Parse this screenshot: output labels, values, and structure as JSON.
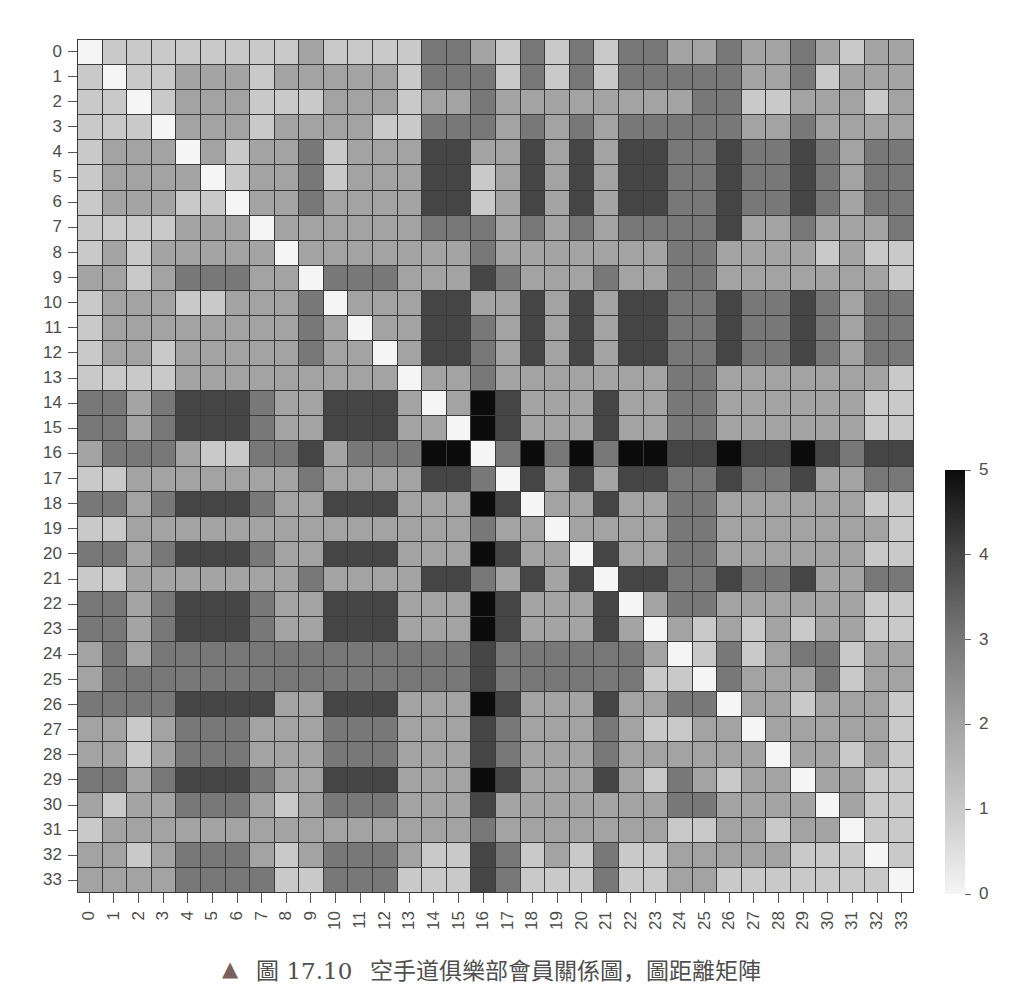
{
  "figure": {
    "caption": {
      "marker": "▲",
      "marker_color": "#7a605d",
      "label": "圖 17.10",
      "text": "空手道俱樂部會員關係圖，圖距離矩陣"
    }
  },
  "chart_data": {
    "type": "heatmap",
    "title": "",
    "xlabel": "",
    "ylabel": "",
    "xlabels": [
      "0",
      "1",
      "2",
      "3",
      "4",
      "5",
      "6",
      "7",
      "8",
      "9",
      "10",
      "11",
      "12",
      "13",
      "14",
      "15",
      "16",
      "17",
      "18",
      "19",
      "20",
      "21",
      "22",
      "23",
      "24",
      "25",
      "26",
      "27",
      "28",
      "29",
      "30",
      "31",
      "32",
      "33"
    ],
    "ylabels": [
      "0",
      "1",
      "2",
      "3",
      "4",
      "5",
      "6",
      "7",
      "8",
      "9",
      "10",
      "11",
      "12",
      "13",
      "14",
      "15",
      "16",
      "17",
      "18",
      "19",
      "20",
      "21",
      "22",
      "23",
      "24",
      "25",
      "26",
      "27",
      "28",
      "29",
      "30",
      "31",
      "32",
      "33"
    ],
    "value_range": [
      0,
      5
    ],
    "colormap": "Greys",
    "grid": true,
    "color_scale": {
      "0": "#f5f5f5",
      "1": "#c9c9c9",
      "2": "#a3a3a3",
      "3": "#787878",
      "4": "#454545",
      "5": "#0b0b0b"
    },
    "colorbar": {
      "position": "right",
      "ticks": [
        0,
        1,
        2,
        3,
        4,
        5
      ],
      "tick_labels": [
        "0",
        "1",
        "2",
        "3",
        "4",
        "5"
      ]
    },
    "matrix": [
      [
        0,
        1,
        1,
        1,
        1,
        1,
        1,
        1,
        1,
        2,
        1,
        1,
        1,
        1,
        3,
        3,
        2,
        1,
        3,
        1,
        3,
        1,
        3,
        3,
        2,
        2,
        3,
        2,
        2,
        3,
        2,
        1,
        2,
        2
      ],
      [
        1,
        0,
        1,
        1,
        2,
        2,
        2,
        1,
        2,
        2,
        2,
        2,
        2,
        1,
        3,
        3,
        3,
        1,
        3,
        1,
        3,
        1,
        3,
        3,
        3,
        3,
        3,
        2,
        2,
        3,
        1,
        2,
        2,
        2
      ],
      [
        1,
        1,
        0,
        1,
        2,
        2,
        2,
        1,
        1,
        1,
        2,
        2,
        2,
        1,
        2,
        2,
        3,
        2,
        2,
        2,
        2,
        2,
        2,
        2,
        2,
        3,
        3,
        1,
        1,
        2,
        2,
        2,
        1,
        2
      ],
      [
        1,
        1,
        1,
        0,
        2,
        2,
        2,
        1,
        2,
        2,
        2,
        2,
        1,
        1,
        3,
        3,
        3,
        2,
        3,
        2,
        3,
        2,
        3,
        3,
        3,
        3,
        3,
        2,
        2,
        3,
        2,
        2,
        2,
        2
      ],
      [
        1,
        2,
        2,
        2,
        0,
        2,
        1,
        2,
        2,
        3,
        1,
        2,
        2,
        2,
        4,
        4,
        2,
        2,
        4,
        2,
        4,
        2,
        4,
        4,
        3,
        3,
        4,
        3,
        3,
        4,
        3,
        2,
        3,
        3
      ],
      [
        1,
        2,
        2,
        2,
        2,
        0,
        1,
        2,
        2,
        3,
        1,
        2,
        2,
        2,
        4,
        4,
        1,
        2,
        4,
        2,
        4,
        2,
        4,
        4,
        3,
        3,
        4,
        3,
        3,
        4,
        3,
        2,
        3,
        3
      ],
      [
        1,
        2,
        2,
        2,
        1,
        1,
        0,
        2,
        2,
        3,
        2,
        2,
        2,
        2,
        4,
        4,
        1,
        2,
        4,
        2,
        4,
        2,
        4,
        4,
        3,
        3,
        4,
        3,
        3,
        4,
        3,
        2,
        3,
        3
      ],
      [
        1,
        1,
        1,
        1,
        2,
        2,
        2,
        0,
        2,
        2,
        2,
        2,
        2,
        2,
        3,
        3,
        3,
        2,
        3,
        2,
        3,
        2,
        3,
        3,
        3,
        3,
        4,
        2,
        2,
        3,
        2,
        2,
        2,
        3
      ],
      [
        1,
        2,
        1,
        2,
        2,
        2,
        2,
        2,
        0,
        2,
        2,
        2,
        2,
        2,
        2,
        2,
        3,
        2,
        2,
        2,
        2,
        2,
        2,
        2,
        3,
        3,
        2,
        2,
        2,
        2,
        1,
        2,
        1,
        1
      ],
      [
        2,
        2,
        1,
        2,
        3,
        3,
        3,
        2,
        2,
        0,
        3,
        3,
        3,
        2,
        2,
        2,
        4,
        3,
        2,
        2,
        2,
        3,
        2,
        2,
        3,
        3,
        2,
        2,
        2,
        2,
        2,
        2,
        2,
        1
      ],
      [
        1,
        2,
        2,
        2,
        1,
        1,
        2,
        2,
        2,
        3,
        0,
        2,
        2,
        2,
        4,
        4,
        2,
        2,
        4,
        2,
        4,
        2,
        4,
        4,
        3,
        3,
        4,
        3,
        3,
        4,
        3,
        2,
        3,
        3
      ],
      [
        1,
        2,
        2,
        2,
        2,
        2,
        2,
        2,
        2,
        3,
        2,
        0,
        2,
        2,
        4,
        4,
        3,
        2,
        4,
        2,
        4,
        2,
        4,
        4,
        3,
        3,
        4,
        3,
        3,
        4,
        3,
        2,
        3,
        3
      ],
      [
        1,
        2,
        2,
        1,
        2,
        2,
        2,
        2,
        2,
        3,
        2,
        2,
        0,
        2,
        4,
        4,
        3,
        2,
        4,
        2,
        4,
        2,
        4,
        4,
        3,
        3,
        4,
        3,
        3,
        4,
        3,
        2,
        3,
        3
      ],
      [
        1,
        1,
        1,
        1,
        2,
        2,
        2,
        2,
        2,
        2,
        2,
        2,
        2,
        0,
        2,
        2,
        3,
        2,
        2,
        2,
        2,
        2,
        2,
        2,
        3,
        3,
        2,
        2,
        2,
        2,
        2,
        2,
        2,
        1
      ],
      [
        3,
        3,
        2,
        3,
        4,
        4,
        4,
        3,
        2,
        2,
        4,
        4,
        4,
        2,
        0,
        2,
        5,
        4,
        2,
        2,
        2,
        4,
        2,
        2,
        3,
        3,
        2,
        2,
        2,
        2,
        2,
        2,
        1,
        1
      ],
      [
        3,
        3,
        2,
        3,
        4,
        4,
        4,
        3,
        2,
        2,
        4,
        4,
        4,
        2,
        2,
        0,
        5,
        4,
        2,
        2,
        2,
        4,
        2,
        2,
        3,
        3,
        2,
        2,
        2,
        2,
        2,
        2,
        1,
        1
      ],
      [
        2,
        3,
        3,
        3,
        2,
        1,
        1,
        3,
        3,
        4,
        2,
        3,
        3,
        3,
        5,
        5,
        0,
        3,
        5,
        3,
        5,
        3,
        5,
        5,
        4,
        4,
        5,
        4,
        4,
        5,
        4,
        3,
        4,
        4
      ],
      [
        1,
        1,
        2,
        2,
        2,
        2,
        2,
        2,
        2,
        3,
        2,
        2,
        2,
        2,
        4,
        4,
        3,
        0,
        4,
        2,
        4,
        2,
        4,
        4,
        3,
        3,
        4,
        3,
        3,
        4,
        2,
        2,
        3,
        3
      ],
      [
        3,
        3,
        2,
        3,
        4,
        4,
        4,
        3,
        2,
        2,
        4,
        4,
        4,
        2,
        2,
        2,
        5,
        4,
        0,
        2,
        2,
        4,
        2,
        2,
        3,
        3,
        2,
        2,
        2,
        2,
        2,
        2,
        1,
        1
      ],
      [
        1,
        1,
        2,
        2,
        2,
        2,
        2,
        2,
        2,
        2,
        2,
        2,
        2,
        2,
        2,
        2,
        3,
        2,
        2,
        0,
        2,
        2,
        2,
        2,
        3,
        3,
        2,
        2,
        2,
        2,
        2,
        2,
        2,
        1
      ],
      [
        3,
        3,
        2,
        3,
        4,
        4,
        4,
        3,
        2,
        2,
        4,
        4,
        4,
        2,
        2,
        2,
        5,
        4,
        2,
        2,
        0,
        4,
        2,
        2,
        3,
        3,
        2,
        2,
        2,
        2,
        2,
        2,
        1,
        1
      ],
      [
        1,
        1,
        2,
        2,
        2,
        2,
        2,
        2,
        2,
        3,
        2,
        2,
        2,
        2,
        4,
        4,
        3,
        2,
        4,
        2,
        4,
        0,
        4,
        4,
        3,
        3,
        4,
        3,
        3,
        4,
        2,
        2,
        3,
        3
      ],
      [
        3,
        3,
        2,
        3,
        4,
        4,
        4,
        3,
        2,
        2,
        4,
        4,
        4,
        2,
        2,
        2,
        5,
        4,
        2,
        2,
        2,
        4,
        0,
        2,
        3,
        3,
        2,
        2,
        2,
        2,
        2,
        2,
        1,
        1
      ],
      [
        3,
        3,
        2,
        3,
        4,
        4,
        4,
        3,
        2,
        2,
        4,
        4,
        4,
        2,
        2,
        2,
        5,
        4,
        2,
        2,
        2,
        4,
        2,
        0,
        2,
        1,
        2,
        1,
        2,
        1,
        2,
        2,
        1,
        1
      ],
      [
        2,
        3,
        2,
        3,
        3,
        3,
        3,
        3,
        3,
        3,
        3,
        3,
        3,
        3,
        3,
        3,
        4,
        3,
        3,
        3,
        3,
        3,
        3,
        2,
        0,
        1,
        3,
        1,
        2,
        3,
        3,
        1,
        2,
        2
      ],
      [
        2,
        3,
        3,
        3,
        3,
        3,
        3,
        3,
        3,
        3,
        3,
        3,
        3,
        3,
        3,
        3,
        4,
        3,
        3,
        3,
        3,
        3,
        3,
        1,
        1,
        0,
        3,
        2,
        2,
        2,
        3,
        1,
        2,
        2
      ],
      [
        3,
        3,
        3,
        3,
        4,
        4,
        4,
        4,
        2,
        2,
        4,
        4,
        4,
        2,
        2,
        2,
        5,
        4,
        2,
        2,
        2,
        4,
        2,
        2,
        3,
        3,
        0,
        2,
        2,
        1,
        2,
        2,
        2,
        1
      ],
      [
        2,
        2,
        1,
        2,
        3,
        3,
        3,
        2,
        2,
        2,
        3,
        3,
        3,
        2,
        2,
        2,
        4,
        3,
        2,
        2,
        2,
        3,
        2,
        1,
        1,
        2,
        2,
        0,
        2,
        2,
        2,
        2,
        2,
        1
      ],
      [
        2,
        2,
        1,
        2,
        3,
        3,
        3,
        2,
        2,
        2,
        3,
        3,
        3,
        2,
        2,
        2,
        4,
        3,
        2,
        2,
        2,
        3,
        2,
        2,
        2,
        2,
        2,
        2,
        0,
        2,
        2,
        1,
        2,
        1
      ],
      [
        3,
        3,
        2,
        3,
        4,
        4,
        4,
        3,
        2,
        2,
        4,
        4,
        4,
        2,
        2,
        2,
        5,
        4,
        2,
        2,
        2,
        4,
        2,
        1,
        3,
        2,
        1,
        2,
        2,
        0,
        2,
        2,
        1,
        1
      ],
      [
        2,
        1,
        2,
        2,
        3,
        3,
        3,
        2,
        1,
        2,
        3,
        3,
        3,
        2,
        2,
        2,
        4,
        2,
        2,
        2,
        2,
        2,
        2,
        2,
        3,
        3,
        2,
        2,
        2,
        2,
        0,
        2,
        1,
        1
      ],
      [
        1,
        2,
        2,
        2,
        2,
        2,
        2,
        2,
        2,
        2,
        2,
        2,
        2,
        2,
        2,
        2,
        3,
        2,
        2,
        2,
        2,
        2,
        2,
        2,
        1,
        1,
        2,
        2,
        1,
        2,
        2,
        0,
        1,
        1
      ],
      [
        2,
        2,
        1,
        2,
        3,
        3,
        3,
        2,
        1,
        2,
        3,
        3,
        3,
        2,
        1,
        1,
        4,
        3,
        1,
        2,
        1,
        3,
        1,
        1,
        2,
        2,
        2,
        2,
        2,
        1,
        1,
        1,
        0,
        1
      ],
      [
        2,
        2,
        2,
        2,
        3,
        3,
        3,
        3,
        1,
        1,
        3,
        3,
        3,
        1,
        1,
        1,
        4,
        3,
        1,
        1,
        1,
        3,
        1,
        1,
        2,
        2,
        1,
        1,
        1,
        1,
        1,
        1,
        1,
        0
      ]
    ]
  }
}
